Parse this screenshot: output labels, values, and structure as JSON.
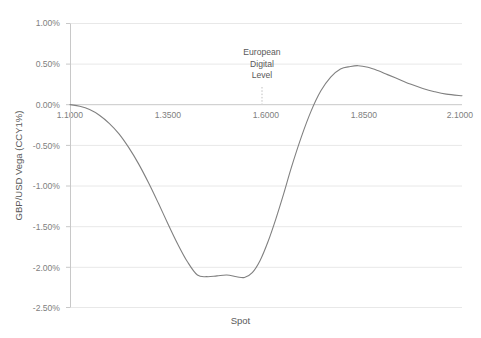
{
  "chart_data": {
    "type": "line",
    "title": "",
    "xlabel": "Spot",
    "ylabel": "GBP/USD Vega (CCY1%)",
    "xlim": [
      1.1,
      2.1
    ],
    "ylim": [
      -0.025,
      0.01
    ],
    "grid": "horizontal",
    "legend": "none",
    "line_color": "#808080",
    "x_tick_labels": [
      "1.1000",
      "1.3500",
      "1.6000",
      "1.8500",
      "2.1000"
    ],
    "x_tick_values": [
      1.1,
      1.35,
      1.6,
      1.85,
      2.1
    ],
    "y_tick_labels": [
      "1.00%",
      "0.50%",
      "0.00%",
      "-0.50%",
      "-1.00%",
      "-1.50%",
      "-2.00%",
      "-2.50%"
    ],
    "y_tick_values": [
      0.01,
      0.005,
      0.0,
      -0.005,
      -0.01,
      -0.015,
      -0.02,
      -0.025
    ],
    "annotations": [
      {
        "name": "european-digital-level",
        "lines": [
          "European",
          "Digital",
          "Level"
        ],
        "x_value": 1.59,
        "marker": "dotted-vertical-line"
      }
    ],
    "series": [
      {
        "name": "GBP/USD Vega",
        "x": [
          1.1,
          1.125,
          1.15,
          1.175,
          1.2,
          1.225,
          1.25,
          1.275,
          1.3,
          1.325,
          1.35,
          1.375,
          1.4,
          1.425,
          1.45,
          1.475,
          1.5,
          1.525,
          1.545,
          1.565,
          1.585,
          1.605,
          1.625,
          1.645,
          1.665,
          1.69,
          1.715,
          1.74,
          1.765,
          1.79,
          1.815,
          1.835,
          1.86,
          1.885,
          1.91,
          1.94,
          1.97,
          2.0,
          2.03,
          2.06,
          2.1
        ],
        "y": [
          0.0,
          -0.0002,
          -0.0006,
          -0.0013,
          -0.0023,
          -0.0036,
          -0.0053,
          -0.0073,
          -0.0096,
          -0.0121,
          -0.0147,
          -0.0172,
          -0.0194,
          -0.021,
          -0.0212,
          -0.0211,
          -0.021,
          -0.0212,
          -0.0213,
          -0.0207,
          -0.0192,
          -0.0169,
          -0.0141,
          -0.011,
          -0.0077,
          -0.004,
          -0.0008,
          0.0017,
          0.0034,
          0.0044,
          0.0047,
          0.0048,
          0.0046,
          0.0042,
          0.0037,
          0.0031,
          0.0025,
          0.002,
          0.0016,
          0.0013,
          0.0011
        ],
        "key_points": {
          "start": {
            "x": 1.1,
            "y": 0.0
          },
          "minimum": {
            "x": 1.545,
            "y": -0.0213
          },
          "zero_crossing": {
            "x": 1.7,
            "y": 0.0
          },
          "maximum": {
            "x": 1.835,
            "y": 0.0048
          },
          "end": {
            "x": 2.1,
            "y": 0.0011
          }
        }
      }
    ]
  }
}
